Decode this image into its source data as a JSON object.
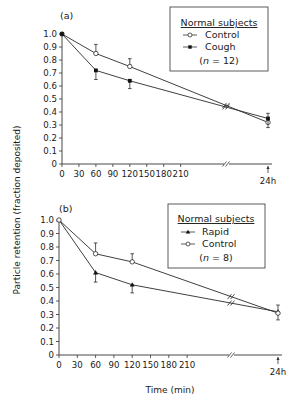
{
  "figure": {
    "ylabel": "Particle retention (fraction deposited)",
    "xlabel": "Time (min)",
    "colors": {
      "line": "#2a2a2a",
      "axis": "#333333",
      "background": "#ffffff"
    }
  },
  "chart_data": [
    {
      "type": "line",
      "panel": "(a)",
      "title": "",
      "xlabel": "Time (min)",
      "ylabel": "Particle retention (fraction deposited)",
      "x_ticks": [
        "0",
        "30",
        "60",
        "90",
        "120",
        "150",
        "180",
        "210",
        "24 h"
      ],
      "y_ticks": [
        "0",
        "0.1",
        "0.2",
        "0.3",
        "0.4",
        "0.5",
        "0.6",
        "0.7",
        "0.8",
        "0.9",
        "1.0"
      ],
      "ylim": [
        0,
        1.0
      ],
      "x_break": "axis break between 210 min and 24 h",
      "x": [
        "0",
        "60",
        "120",
        "24 h"
      ],
      "legend": {
        "title": "Normal subjects",
        "n_label": "(n = 12)",
        "position": "upper right"
      },
      "series": [
        {
          "name": "Control",
          "marker": "open-circle",
          "values": [
            1.0,
            0.85,
            0.75,
            0.32
          ],
          "error_upper": [
            null,
            0.92,
            0.81,
            0.39
          ]
        },
        {
          "name": "Cough",
          "marker": "filled-square",
          "values": [
            1.0,
            0.72,
            0.64,
            0.35
          ],
          "error_lower": [
            null,
            0.65,
            0.58,
            0.28
          ]
        }
      ]
    },
    {
      "type": "line",
      "panel": "(b)",
      "title": "",
      "xlabel": "Time (min)",
      "ylabel": "Particle retention (fraction deposited)",
      "x_ticks": [
        "0",
        "30",
        "60",
        "90",
        "120",
        "150",
        "180",
        "210",
        "24 h"
      ],
      "y_ticks": [
        "0",
        "0.1",
        "0.2",
        "0.3",
        "0.4",
        "0.5",
        "0.6",
        "0.7",
        "0.8",
        "0.9",
        "1.0"
      ],
      "ylim": [
        0,
        1.0
      ],
      "x_break": "axis break between 210 min and 24 h",
      "x": [
        "0",
        "60",
        "120",
        "24 h"
      ],
      "legend": {
        "title": "Normal subjects",
        "n_label": "(n = 8)",
        "position": "upper right"
      },
      "series": [
        {
          "name": "Rapid",
          "marker": "filled-triangle",
          "values": [
            1.0,
            0.61,
            0.52,
            0.32
          ],
          "error_lower": [
            null,
            0.54,
            0.46,
            0.26
          ]
        },
        {
          "name": "Control",
          "marker": "open-circle",
          "values": [
            1.0,
            0.75,
            0.69,
            0.31
          ],
          "error_upper": [
            null,
            0.83,
            0.75,
            0.37
          ]
        }
      ]
    }
  ],
  "panels": {
    "a": {
      "label": "(a)",
      "legend_title": "Normal subjects",
      "legend_item1": "Control",
      "legend_item2": "Cough",
      "n_label_pre": "(",
      "n_label_n": "n",
      "n_label_post": " = 12)",
      "last_tick": "24 h"
    },
    "b": {
      "label": "(b)",
      "legend_title": "Normal subjects",
      "legend_item1": "Rapid",
      "legend_item2": "Control",
      "n_label_pre": "(",
      "n_label_n": "n",
      "n_label_post": " = 8)",
      "last_tick": "24 h"
    }
  }
}
